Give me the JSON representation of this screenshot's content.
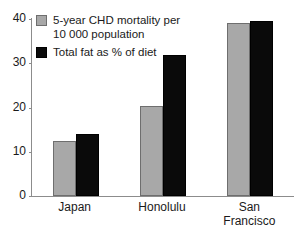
{
  "chart_data": {
    "type": "bar",
    "title": "",
    "xlabel": "",
    "ylabel": "",
    "ylim": [
      0,
      40
    ],
    "yticks": [
      0,
      10,
      20,
      30,
      40
    ],
    "ytick_labels": [
      "0",
      "10",
      "20",
      "30",
      "40"
    ],
    "grid": false,
    "legend_position": "top-left",
    "categories": [
      "Japan",
      "Honolulu",
      "San\nFrancisco"
    ],
    "series": [
      {
        "name": "5-year CHD mortality per\n10 000 population",
        "color": "#a8a8a8",
        "values": [
          12.4,
          20.3,
          39.0
        ]
      },
      {
        "name": "Total fat as % of diet",
        "color": "#0a0a0a",
        "values": [
          14.0,
          31.8,
          39.6
        ]
      }
    ]
  },
  "legend": {
    "items": [
      {
        "label": "5-year CHD mortality per\n10 000 population",
        "swatch": "grey-swatch"
      },
      {
        "label": "Total fat as % of diet",
        "swatch": "black-swatch"
      }
    ]
  },
  "colors": {
    "series_a": "#a8a8a8",
    "series_b": "#0a0a0a",
    "axis": "#8c8c8c",
    "text": "#1a1a1a",
    "background": "#ffffff"
  }
}
